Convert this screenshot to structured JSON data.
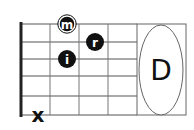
{
  "chord": {
    "name": "D",
    "strings": 6,
    "frets_shown": 4
  },
  "fingers": [
    {
      "label": "m",
      "string_row": 0,
      "fret": 2,
      "style": "outlined"
    },
    {
      "label": "r",
      "string_row": 1,
      "fret": 3,
      "style": "filled"
    },
    {
      "label": "i",
      "string_row": 2,
      "fret": 2,
      "style": "filled"
    }
  ],
  "muted": [
    {
      "label": "x",
      "string_row": 5
    }
  ],
  "colors": {
    "line": "#555555",
    "nut": "#222222",
    "dot": "#111111",
    "ellipse": "#666666"
  }
}
